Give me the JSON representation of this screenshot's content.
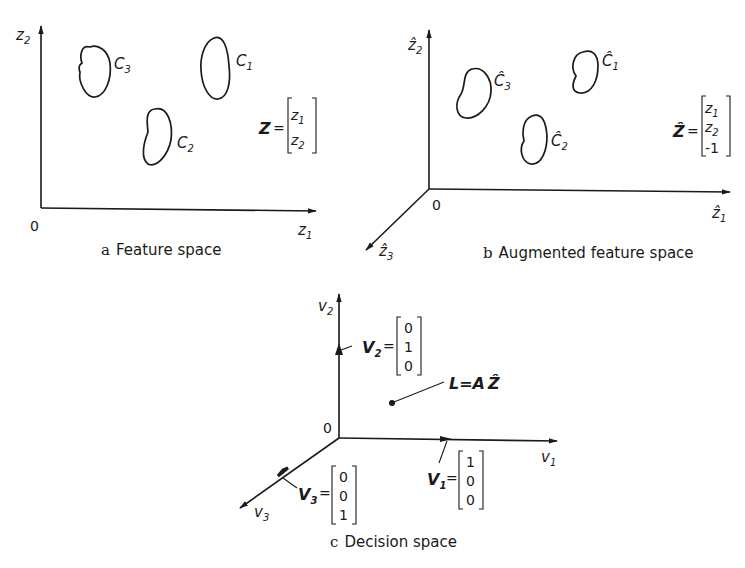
{
  "figure": {
    "panels": [
      {
        "id": "a",
        "caption_letter": "a",
        "caption_text": "Feature space",
        "origin_label": "0",
        "x_axis_label": "z",
        "x_axis_sub": "1",
        "y_axis_label": "z",
        "y_axis_sub": "2",
        "classes": [
          {
            "label": "C",
            "sub": "3"
          },
          {
            "label": "C",
            "sub": "1"
          },
          {
            "label": "C",
            "sub": "2"
          }
        ],
        "vector": {
          "name": "Z",
          "eq": "=",
          "entries": [
            {
              "t": "z",
              "s": "1"
            },
            {
              "t": "z",
              "s": "2"
            }
          ]
        }
      },
      {
        "id": "b",
        "caption_letter": "b",
        "caption_text": "Augmented feature space",
        "origin_label": "0",
        "x_axis_label": "ẑ",
        "x_axis_sub": "1",
        "y_axis_label": "ẑ",
        "y_axis_sub": "2",
        "z_axis_label": "ẑ",
        "z_axis_sub": "3",
        "classes": [
          {
            "label": "Ĉ",
            "sub": "3"
          },
          {
            "label": "Ĉ",
            "sub": "1"
          },
          {
            "label": "Ĉ",
            "sub": "2"
          }
        ],
        "vector": {
          "name": "Ẑ",
          "eq": "=",
          "entries": [
            {
              "t": "z",
              "s": "1"
            },
            {
              "t": "z",
              "s": "2"
            },
            {
              "t": "-1",
              "s": ""
            }
          ]
        }
      },
      {
        "id": "c",
        "caption_letter": "c",
        "caption_text": "Decision space",
        "origin_label": "0",
        "x_axis_label": "v",
        "x_axis_sub": "1",
        "y_axis_label": "v",
        "y_axis_sub": "2",
        "z_axis_label": "v",
        "z_axis_sub": "3",
        "unit_vectors": [
          {
            "name": "V",
            "sub": "1",
            "eq": "=",
            "entries": [
              "1",
              "0",
              "0"
            ]
          },
          {
            "name": "V",
            "sub": "2",
            "eq": "=",
            "entries": [
              "0",
              "1",
              "0"
            ]
          },
          {
            "name": "V",
            "sub": "3",
            "eq": "=",
            "entries": [
              "0",
              "0",
              "1"
            ]
          }
        ],
        "point_label": "L=A",
        "point_label_hat": "Ẑ"
      }
    ]
  }
}
